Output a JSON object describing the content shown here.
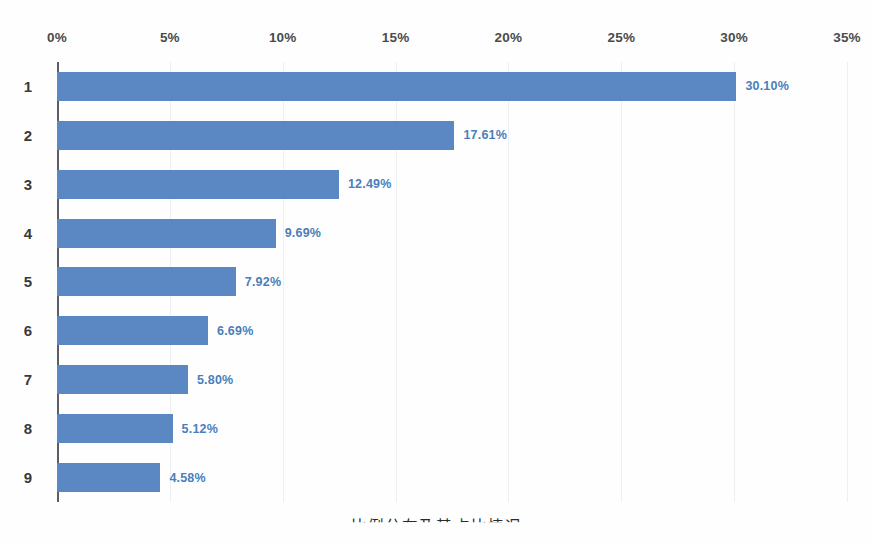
{
  "chart_data": {
    "type": "bar",
    "orientation": "horizontal",
    "title": "",
    "subtitle": "",
    "xlabel": "",
    "ylabel": "",
    "categories": [
      "1",
      "2",
      "3",
      "4",
      "5",
      "6",
      "7",
      "8",
      "9"
    ],
    "values": [
      30.1,
      17.61,
      12.49,
      9.69,
      7.92,
      6.69,
      5.8,
      5.12,
      4.58
    ],
    "data_labels": [
      "30.10%",
      "17.61%",
      "12.49%",
      "9.69%",
      "7.92%",
      "6.69%",
      "5.80%",
      "5.12%",
      "4.58%"
    ],
    "xlim": [
      0,
      35
    ],
    "xticks": [
      0,
      5,
      10,
      15,
      20,
      25,
      30,
      35
    ],
    "xtick_labels": [
      "0%",
      "5%",
      "10%",
      "15%",
      "20%",
      "25%",
      "30%",
      "35%"
    ],
    "xaxis_position": "top",
    "grid": true,
    "grid_axis": "x",
    "legend": false,
    "series": [
      {
        "name": "",
        "values": [
          30.1,
          17.61,
          12.49,
          9.69,
          7.92,
          6.69,
          5.8,
          5.12,
          4.58
        ]
      }
    ],
    "colors": {
      "bar_fill": "#5b87c2",
      "data_label": "#4a7ebb",
      "tick_label": "#4b4b4b",
      "category_label": "#3a3a3a",
      "gridline": "#eceff3",
      "axis_line": "#5a5f66",
      "background": "#fefefe"
    }
  },
  "caption": {
    "text": "比例分布及其占比情况",
    "note": "clipped"
  }
}
